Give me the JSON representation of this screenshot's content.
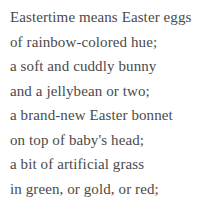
{
  "poem": {
    "text_color": "#4a4a4a",
    "background_color": "#ffffff",
    "lines": [
      "Eastertime means Easter eggs",
      "of rainbow-colored hue;",
      "a soft and cuddly bunny",
      "and a jellybean or two;",
      "a brand-new Easter bonnet",
      "on top of baby's head;",
      "a bit of artificial grass",
      "in green, or gold, or red;"
    ]
  }
}
